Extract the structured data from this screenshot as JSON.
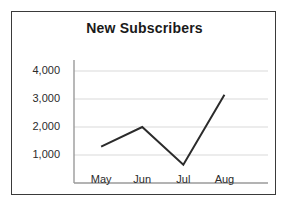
{
  "chart_data": {
    "type": "line",
    "title": "New Subscribers",
    "xlabel": "",
    "ylabel": "",
    "categories": [
      "May",
      "Jun",
      "Jul",
      "Aug"
    ],
    "values": [
      1300,
      2000,
      650,
      3150
    ],
    "series": [
      {
        "name": "New Subscribers",
        "values": [
          1300,
          2000,
          650,
          3150
        ]
      }
    ],
    "ylim": [
      0,
      4500
    ],
    "ytick_labels": [
      "1,000",
      "2,000",
      "3,000",
      "4,000"
    ],
    "ytick_values": [
      1000,
      2000,
      3000,
      4000
    ],
    "xtick_labels": [
      "May",
      "Jun",
      "Jul",
      "Aug"
    ],
    "grid": true,
    "grid_axis": "y",
    "legend": false,
    "legend_position": "none",
    "markers": false,
    "line_color": "#2b2b2b",
    "grid_color": "#d9d9d9",
    "axis_color": "#9a9a9a",
    "background_color": "#ffffff",
    "border_color": "#3a3a3a",
    "text_color": "#1a1a1a"
  }
}
